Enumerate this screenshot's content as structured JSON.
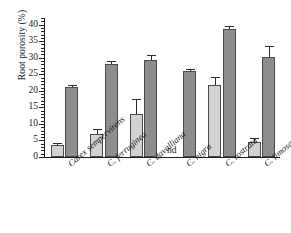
{
  "chart_data": {
    "type": "bar",
    "title": "",
    "xlabel": "",
    "ylabel": "Root porosity (%)",
    "ylim": [
      0,
      42
    ],
    "ytick_labels": [
      "0",
      "5",
      "10",
      "15",
      "20",
      "25",
      "30",
      "35",
      "40"
    ],
    "ytick_values": [
      0,
      5,
      10,
      15,
      20,
      25,
      30,
      35,
      40
    ],
    "minor_tick_step": 1,
    "grid": false,
    "legend": "none",
    "categories": [
      "Carex sempervirens",
      "C. ferruginea",
      "C. davalliana",
      "C. nigra",
      "C. rostrata",
      "C. limosa"
    ],
    "series": [
      {
        "name": "light-gray-series",
        "color": "#d2d2d2",
        "values": [
          3.5,
          7.0,
          13.0,
          null,
          21.8,
          4.5
        ],
        "errors": [
          0.4,
          1.2,
          4.3,
          null,
          2.1,
          0.9
        ]
      },
      {
        "name": "dark-gray-series",
        "color": "#8d8d8d",
        "values": [
          21.3,
          28.0,
          29.2,
          25.9,
          38.8,
          30.3
        ],
        "errors": [
          0.3,
          0.7,
          1.4,
          0.5,
          0.5,
          3.0
        ]
      }
    ],
    "annotations": [
      {
        "text": "nd",
        "category": "C. nigra",
        "series": "light-gray-series"
      }
    ]
  }
}
